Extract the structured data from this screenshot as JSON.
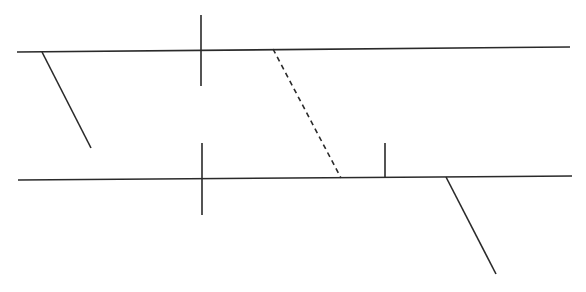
{
  "diagram": {
    "type": "line-sketch",
    "background": "#ffffff",
    "stroke_color": "#2a2a2a",
    "lines": [
      {
        "id": "top-horizontal",
        "x1": 17,
        "y1": 52,
        "x2": 570,
        "y2": 47,
        "style": "solid"
      },
      {
        "id": "top-vertical-cross",
        "x1": 201,
        "y1": 15,
        "x2": 201,
        "y2": 86,
        "style": "solid"
      },
      {
        "id": "left-slant",
        "x1": 42,
        "y1": 52,
        "x2": 91,
        "y2": 148,
        "style": "solid"
      },
      {
        "id": "dashed-connector",
        "x1": 273,
        "y1": 49,
        "x2": 341,
        "y2": 178,
        "style": "dashed"
      },
      {
        "id": "bottom-horizontal",
        "x1": 18,
        "y1": 180,
        "x2": 572,
        "y2": 176,
        "style": "solid"
      },
      {
        "id": "bottom-vertical-cross",
        "x1": 202,
        "y1": 143,
        "x2": 202,
        "y2": 215,
        "style": "solid"
      },
      {
        "id": "bottom-tick",
        "x1": 385,
        "y1": 143,
        "x2": 385,
        "y2": 178,
        "style": "solid"
      },
      {
        "id": "right-slant",
        "x1": 446,
        "y1": 177,
        "x2": 496,
        "y2": 274,
        "style": "solid"
      }
    ]
  }
}
